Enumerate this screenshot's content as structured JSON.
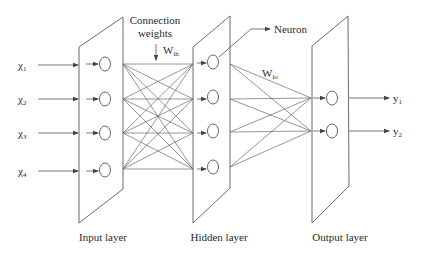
{
  "diagram": {
    "type": "feedforward-neural-network",
    "annotations": {
      "connection_weights_line1": "Connection",
      "connection_weights_line2": "weights",
      "w_ih": "W",
      "w_ih_sub": "ih",
      "w_io": "W",
      "w_io_sub": "io",
      "neuron": "Neuron"
    },
    "layers": [
      {
        "id": "input",
        "label": "Input layer",
        "neurons": 4
      },
      {
        "id": "hidden",
        "label": "Hidden layer",
        "neurons": 4
      },
      {
        "id": "output",
        "label": "Output layer",
        "neurons": 2
      }
    ],
    "inputs": [
      {
        "symbol": "χ",
        "sub": "1"
      },
      {
        "symbol": "χ",
        "sub": "2"
      },
      {
        "symbol": "χ",
        "sub": "3"
      },
      {
        "symbol": "χ",
        "sub": "4"
      }
    ],
    "outputs": [
      {
        "symbol": "y",
        "sub": "1"
      },
      {
        "symbol": "y",
        "sub": "2"
      }
    ],
    "connections": {
      "input_to_hidden": "fully-connected (4×4)",
      "hidden_to_output": "fully-connected (4×2)"
    },
    "colors": {
      "stroke": "#555555",
      "text": "#2a2a2a",
      "background": "#ffffff"
    }
  }
}
